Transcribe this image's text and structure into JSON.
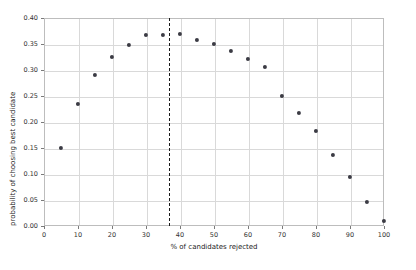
{
  "chart_data": {
    "type": "scatter",
    "title": "",
    "xlabel": "% of candidates rejected",
    "ylabel": "probability of choosing best candidate",
    "xlim": [
      0,
      100
    ],
    "ylim": [
      0.0,
      0.4
    ],
    "grid": true,
    "legend": "none",
    "xticks": [
      0,
      10,
      20,
      30,
      40,
      50,
      60,
      70,
      80,
      90,
      100
    ],
    "xticklabels": [
      "0",
      "10",
      "20",
      "30",
      "40",
      "50",
      "60",
      "70",
      "80",
      "90",
      "100"
    ],
    "yticks": [
      0.0,
      0.05,
      0.1,
      0.15,
      0.2,
      0.25,
      0.3,
      0.35,
      0.4
    ],
    "yticklabels": [
      "0.00",
      "0.05",
      "0.10",
      "0.15",
      "0.20",
      "0.25",
      "0.30",
      "0.35",
      "0.40"
    ],
    "x": [
      5,
      10,
      15,
      20,
      25,
      30,
      35,
      40,
      45,
      50,
      55,
      60,
      65,
      70,
      75,
      80,
      85,
      90,
      95,
      100
    ],
    "values": [
      0.15,
      0.235,
      0.29,
      0.325,
      0.348,
      0.368,
      0.368,
      0.369,
      0.358,
      0.35,
      0.337,
      0.321,
      0.306,
      0.25,
      0.218,
      0.183,
      0.137,
      0.095,
      0.047,
      0.01
    ],
    "series": [
      {
        "name": "probability of choosing best candidate",
        "marker": "circle",
        "color": "#3b3b44",
        "values": [
          0.15,
          0.235,
          0.29,
          0.325,
          0.348,
          0.368,
          0.368,
          0.369,
          0.358,
          0.35,
          0.337,
          0.321,
          0.306,
          0.25,
          0.218,
          0.183,
          0.137,
          0.095,
          0.047,
          0.01
        ]
      }
    ],
    "annotations": [
      {
        "type": "vertical-line",
        "name": "optimal-threshold-line",
        "x": 36.8,
        "style": "dashed",
        "color": "#1a1a1a"
      }
    ],
    "colors": {
      "background": "#ffffff",
      "gridline": "#d9d9d9",
      "axis": "#bdbdbd",
      "marker": "#3b3b44",
      "text": "#333333"
    }
  }
}
